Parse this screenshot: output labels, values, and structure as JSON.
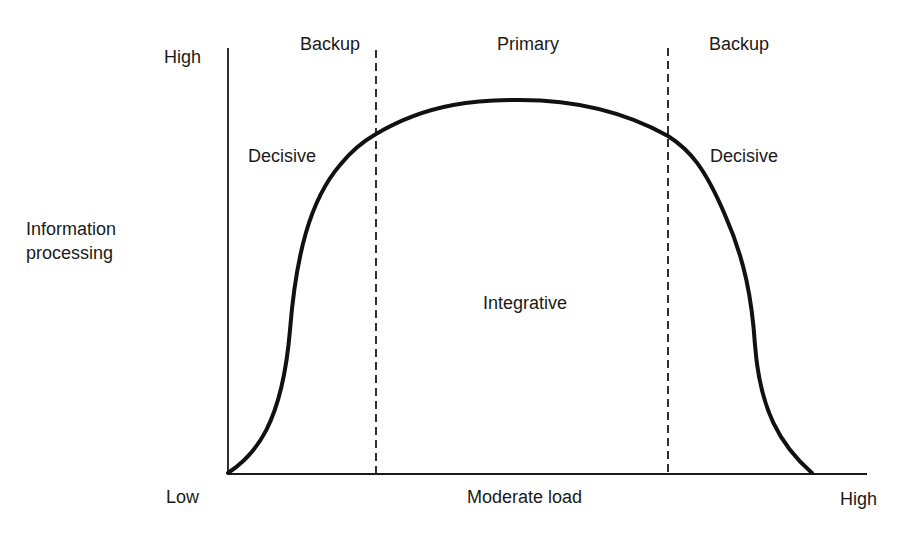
{
  "diagram": {
    "y_axis": {
      "title_line1": "Information",
      "title_line2": "processing",
      "high_label": "High"
    },
    "x_axis": {
      "low_label": "Low",
      "mid_label": "Moderate load",
      "high_label": "High"
    },
    "zones": {
      "left": "Backup",
      "center": "Primary",
      "right": "Backup"
    },
    "regions": {
      "left_decisive": "Decisive",
      "right_decisive": "Decisive",
      "center": "Integrative"
    },
    "colors": {
      "ink": "#1a1a1a",
      "background": "#ffffff"
    }
  }
}
